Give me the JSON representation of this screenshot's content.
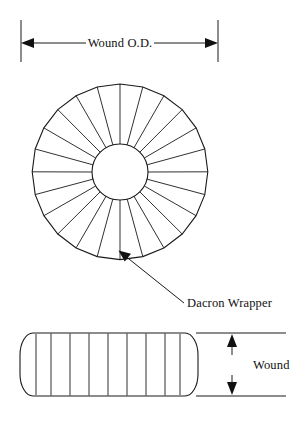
{
  "figure": {
    "background_color": "#ffffff",
    "line_color": "#1a1a1a",
    "width": 291,
    "height": 421
  },
  "labels": {
    "wound_od": "Wound O.D.",
    "dacron_wrapper": "Dacron Wrapper",
    "wound_ht": "Wound Ht"
  },
  "icons": {
    "arrow_left": "arrow-left-icon",
    "arrow_right": "arrow-right-icon",
    "arrow_up": "arrow-up-icon",
    "arrow_down": "arrow-down-icon",
    "leader_arrow": "leader-arrow-icon"
  },
  "geometry": {
    "top_view": {
      "center_x": 120,
      "center_y": 172,
      "outer_radius": 88,
      "inner_radius": 28,
      "segment_count": 24,
      "start_angle_deg": -90
    },
    "od_dimension": {
      "y": 43,
      "left_x": 21,
      "right_x": 218,
      "ext_top_y": 20,
      "ext_bottom_y": 62
    },
    "leader": {
      "tip_x": 120,
      "tip_y": 252,
      "elbow_x": 152,
      "elbow_y": 281,
      "end_x": 184,
      "end_y": 303
    },
    "side_view": {
      "left_x": 20,
      "right_x": 198,
      "top_y": 333,
      "bottom_y": 396,
      "corner_radius": 13,
      "division_count": 10
    },
    "ht_dimension": {
      "x": 232,
      "top_y": 333,
      "bottom_y": 396,
      "ext_left_x": 196,
      "ext_right_x": 286
    }
  }
}
